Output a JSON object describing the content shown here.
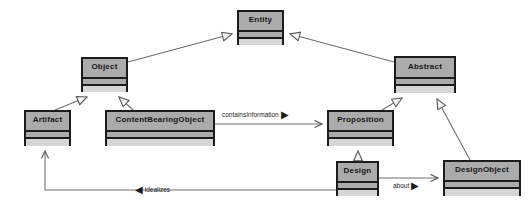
{
  "diagram": {
    "type": "uml-class-diagram",
    "canvas": {
      "width": 531,
      "height": 206,
      "background": "#ffffff"
    },
    "style": {
      "class_fill": "#ababab",
      "class_border": "#1c1c1c",
      "operations_fill": "#d6d6d6",
      "edge_color": "#6e6e6e",
      "generalization_fill": "#f2f2f2",
      "label_color": "#1d1d1d"
    },
    "classes": [
      {
        "id": "entity",
        "name": "Entity",
        "x": 237,
        "y": 10,
        "w": 47,
        "h": 35,
        "name_h": 18,
        "attrs_h": 8,
        "ops_h": 9,
        "font_size": 8
      },
      {
        "id": "object",
        "name": "Object",
        "x": 81,
        "y": 57,
        "w": 47,
        "h": 35,
        "name_h": 18,
        "attrs_h": 8,
        "ops_h": 9,
        "font_size": 8
      },
      {
        "id": "abstract",
        "name": "Abstract",
        "x": 394,
        "y": 56,
        "w": 62,
        "h": 37,
        "name_h": 19,
        "attrs_h": 8,
        "ops_h": 10,
        "font_size": 8
      },
      {
        "id": "artifact",
        "name": "Artifact",
        "x": 24,
        "y": 110,
        "w": 47,
        "h": 36,
        "name_h": 18,
        "attrs_h": 8,
        "ops_h": 10,
        "font_size": 8
      },
      {
        "id": "contentbearingobject",
        "name": "ContentBearingObject",
        "x": 105,
        "y": 110,
        "w": 110,
        "h": 36,
        "name_h": 18,
        "attrs_h": 8,
        "ops_h": 10,
        "font_size": 8
      },
      {
        "id": "proposition",
        "name": "Proposition",
        "x": 327,
        "y": 110,
        "w": 67,
        "h": 36,
        "name_h": 18,
        "attrs_h": 8,
        "ops_h": 10,
        "font_size": 8
      },
      {
        "id": "design",
        "name": "Design",
        "x": 336,
        "y": 161,
        "w": 43,
        "h": 35,
        "name_h": 18,
        "attrs_h": 8,
        "ops_h": 9,
        "font_size": 8
      },
      {
        "id": "designobject",
        "name": "DesignObject",
        "x": 443,
        "y": 160,
        "w": 78,
        "h": 36,
        "name_h": 18,
        "attrs_h": 8,
        "ops_h": 10,
        "font_size": 8
      }
    ],
    "relationships": [
      {
        "id": "object-entity",
        "kind": "generalization",
        "source": "object",
        "target": "entity"
      },
      {
        "id": "abstract-entity",
        "kind": "generalization",
        "source": "abstract",
        "target": "entity"
      },
      {
        "id": "artifact-object",
        "kind": "generalization",
        "source": "artifact",
        "target": "object"
      },
      {
        "id": "cbo-object",
        "kind": "generalization",
        "source": "contentbearingobject",
        "target": "object"
      },
      {
        "id": "proposition-abstract",
        "kind": "generalization",
        "source": "proposition",
        "target": "abstract"
      },
      {
        "id": "designobject-abstract",
        "kind": "generalization",
        "source": "designobject",
        "target": "abstract"
      },
      {
        "id": "design-proposition",
        "kind": "generalization",
        "source": "design",
        "target": "proposition"
      },
      {
        "id": "containsinformation",
        "kind": "association",
        "source": "contentbearingobject",
        "target": "proposition",
        "label": "containsInformation",
        "marker": "▶",
        "marker_position": "after",
        "label_x": 222,
        "label_y": 110,
        "font_size": 6.5
      },
      {
        "id": "about",
        "kind": "association",
        "source": "design",
        "target": "designobject",
        "label": "about",
        "marker": "▶",
        "marker_position": "after",
        "label_x": 393,
        "label_y": 182,
        "font_size": 6.5
      },
      {
        "id": "idealizes",
        "kind": "association",
        "source": "design",
        "target": "artifact",
        "label": "idealizes",
        "marker": "◀",
        "marker_position": "before",
        "label_x": 135,
        "label_y": 186,
        "font_size": 6.5
      }
    ]
  }
}
